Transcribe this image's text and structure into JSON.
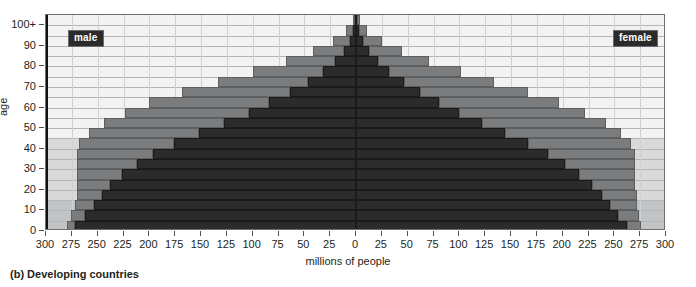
{
  "caption": "(b) Developing countries",
  "axes": {
    "y_title": "age",
    "x_title": "millions of people",
    "y_ticks": [
      "0",
      "10",
      "20",
      "30",
      "40",
      "50",
      "60",
      "70",
      "80",
      "90",
      "100+"
    ],
    "x_ticks_left": [
      "300",
      "275",
      "250",
      "225",
      "200",
      "175",
      "150",
      "125",
      "100",
      "75",
      "50",
      "25"
    ],
    "x_ticks_right": [
      "0",
      "25",
      "50",
      "75",
      "100",
      "125",
      "150",
      "175",
      "200",
      "225",
      "250",
      "275",
      "300"
    ]
  },
  "series_labels": {
    "male": "male",
    "female": "female"
  },
  "colors": {
    "dark": "#2b2b2b",
    "light": "#7b7c7e",
    "plot_bg": "#f2f2f2",
    "band_mid": "#d9d9d9",
    "band_low": "#c2c3c5",
    "axis": "#231f20"
  },
  "chart_data": {
    "type": "bar",
    "title": "(b) Developing countries",
    "subtitle": "",
    "xlabel": "millions of people",
    "ylabel": "age",
    "orientation": "horizontal",
    "style": "population-pyramid-back-to-back-stacked",
    "xlim": [
      -300,
      300
    ],
    "x_abs_ticks": [
      0,
      25,
      50,
      75,
      100,
      125,
      150,
      175,
      200,
      225,
      250,
      275,
      300
    ],
    "grid": true,
    "legend_position": "inside-top-left-and-top-right",
    "categories": [
      "0-4",
      "5-9",
      "10-14",
      "15-19",
      "20-24",
      "25-29",
      "30-34",
      "35-39",
      "40-44",
      "45-49",
      "50-54",
      "55-59",
      "60-64",
      "65-69",
      "70-74",
      "75-79",
      "80-84",
      "85-89",
      "90-94",
      "95-99",
      "100+"
    ],
    "legend": [
      "male",
      "female"
    ],
    "series": [
      {
        "name": "male-current",
        "side": "left",
        "values": [
          272,
          262,
          254,
          246,
          238,
          226,
          212,
          196,
          176,
          152,
          128,
          104,
          84,
          64,
          46,
          32,
          20,
          12,
          6,
          3,
          1
        ]
      },
      {
        "name": "male-projected",
        "side": "left",
        "values": [
          8,
          14,
          18,
          24,
          32,
          44,
          58,
          74,
          92,
          106,
          116,
          120,
          116,
          104,
          88,
          68,
          48,
          30,
          16,
          7,
          2
        ]
      },
      {
        "name": "female-current",
        "side": "right",
        "values": [
          262,
          254,
          246,
          238,
          228,
          216,
          202,
          186,
          166,
          144,
          122,
          100,
          80,
          62,
          46,
          32,
          21,
          13,
          7,
          3,
          1
        ]
      },
      {
        "name": "female-projected",
        "side": "right",
        "values": [
          14,
          20,
          26,
          34,
          42,
          54,
          68,
          84,
          100,
          112,
          120,
          122,
          116,
          104,
          88,
          70,
          50,
          32,
          18,
          8,
          3
        ]
      }
    ]
  }
}
